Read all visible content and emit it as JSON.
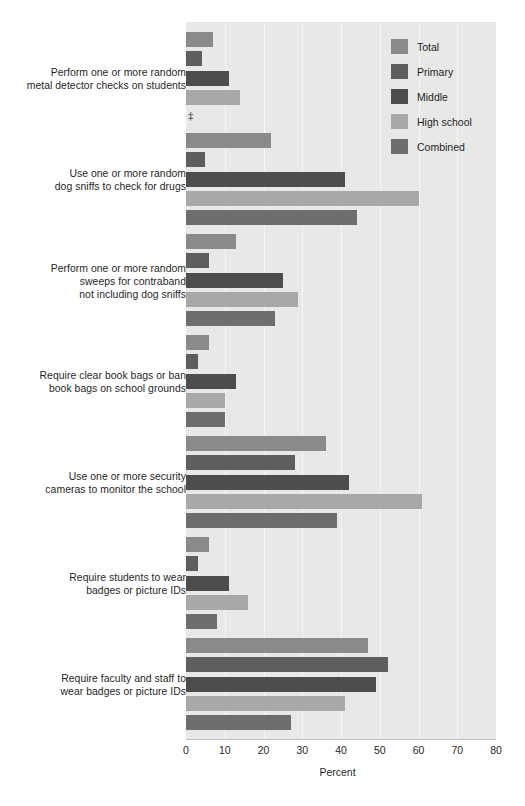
{
  "chart_data": {
    "type": "bar",
    "orientation": "horizontal",
    "title": "",
    "xlabel": "Percent",
    "ylabel": "",
    "xlim": [
      0,
      80
    ],
    "xticks": [
      0,
      10,
      20,
      30,
      40,
      50,
      60,
      70,
      80
    ],
    "xtick_labels": [
      "0",
      "10",
      "20",
      "30",
      "40",
      "50",
      "60",
      "70",
      "80"
    ],
    "grid": true,
    "grid_axis": "x",
    "legend_position": "top-right",
    "suppressed_marker": "‡",
    "suppressed_note": "‡ Reporting standards not met",
    "categories": [
      "Perform one or more random metal detector checks on students",
      "Use one or more random dog sniffs to check for drugs",
      "Perform one or more random sweeps for contraband not including dog sniffs",
      "Require clear book bags or ban book bags on school grounds",
      "Use one or more security cameras to monitor the school",
      "Require students to wear badges or picture IDs",
      "Require faculty and staff to wear badges or picture IDs"
    ],
    "category_lines": [
      [
        "Perform one or more random",
        "metal detector checks on students"
      ],
      [
        "Use one or more random",
        "dog sniffs to check for drugs"
      ],
      [
        "Perform one or more random",
        "sweeps for contraband",
        "not including dog sniffs"
      ],
      [
        "Require clear book bags or ban",
        "book bags on school grounds"
      ],
      [
        "Use one or more security",
        "cameras to monitor the school"
      ],
      [
        "Require students to wear",
        "badges or picture IDs"
      ],
      [
        "Require faculty and staff to",
        "wear badges or picture IDs"
      ]
    ],
    "series": [
      {
        "name": "Total",
        "color": "#8a8a88",
        "values": [
          7,
          22,
          13,
          6,
          36,
          6,
          47
        ]
      },
      {
        "name": "Primary",
        "color": "#5e5e5c",
        "values": [
          4,
          5,
          6,
          3,
          28,
          3,
          52
        ]
      },
      {
        "name": "Middle",
        "color": "#4d4d4b",
        "values": [
          11,
          41,
          25,
          13,
          42,
          11,
          49
        ]
      },
      {
        "name": "High school",
        "color": "#a8a8a6",
        "values": [
          14,
          60,
          29,
          10,
          61,
          16,
          41
        ]
      },
      {
        "name": "Combined",
        "color": "#6d6d6b",
        "values": [
          null,
          44,
          23,
          10,
          39,
          8,
          27
        ]
      }
    ]
  },
  "legend": {
    "items": [
      {
        "label": "Total",
        "color": "#8a8a88"
      },
      {
        "label": "Primary",
        "color": "#5e5e5c"
      },
      {
        "label": "Middle",
        "color": "#4d4d4b"
      },
      {
        "label": "High school",
        "color": "#a8a8a6"
      },
      {
        "label": "Combined",
        "color": "#6d6d6b"
      }
    ]
  },
  "axis": {
    "title": "Percent",
    "ticks": [
      "0",
      "10",
      "20",
      "30",
      "40",
      "50",
      "60",
      "70",
      "80"
    ]
  }
}
